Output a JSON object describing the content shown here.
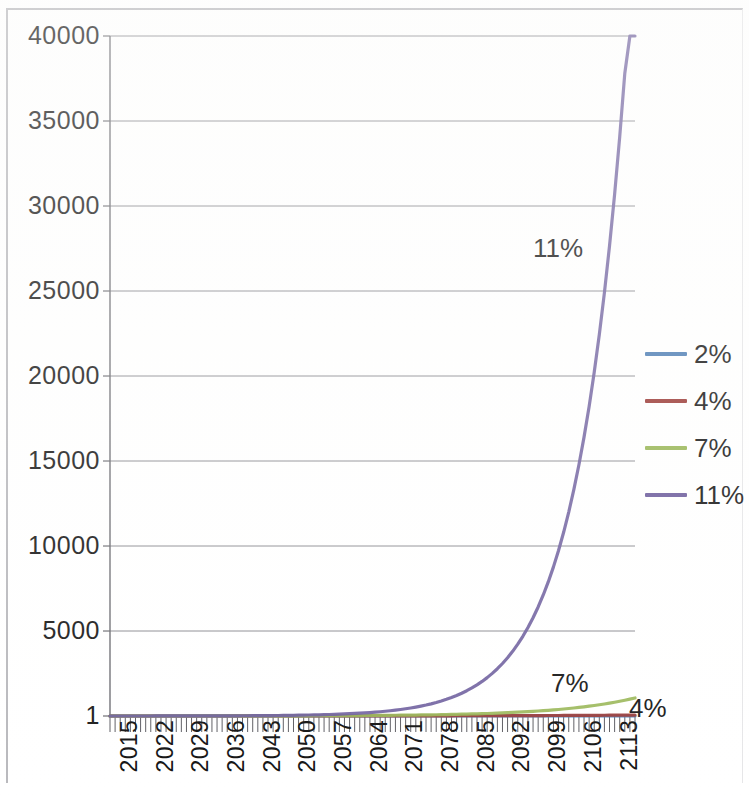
{
  "chart_data": {
    "type": "line",
    "title": "",
    "subtitle": "",
    "xlabel": "",
    "ylabel": "",
    "grid": true,
    "legend_position": "right",
    "xlim": [
      2015,
      2118
    ],
    "ylim": [
      1,
      40000
    ],
    "y_ticks": [
      40000,
      35000,
      30000,
      25000,
      20000,
      15000,
      10000,
      5000,
      1
    ],
    "y_tick_labels": [
      "40000",
      "35000",
      "30000",
      "25000",
      "20000",
      "15000",
      "10000",
      "5000",
      "1"
    ],
    "x_ticks": [
      2015,
      2022,
      2029,
      2036,
      2043,
      2050,
      2057,
      2064,
      2071,
      2078,
      2085,
      2092,
      2099,
      2106,
      2113
    ],
    "x_tick_labels": [
      "2015",
      "2022",
      "2029",
      "2036",
      "2043",
      "2050",
      "2057",
      "2064",
      "2071",
      "2078",
      "2085",
      "2092",
      "2099",
      "2106",
      "2113"
    ],
    "x_start": 2015,
    "x_end": 2118,
    "annotations": [
      {
        "label": "11%",
        "x": 2108,
        "y": 26500
      },
      {
        "label": "7%",
        "x": 2106,
        "y": 2800
      },
      {
        "label": "4%",
        "x": 2117,
        "y": 1400
      }
    ],
    "series": [
      {
        "name": "2%",
        "color": "#4f7fb5",
        "start_value": 1,
        "growth_rate": 0.02,
        "end_value": 7.7,
        "values": [
          1,
          1.22,
          1.49,
          1.81,
          2.21,
          2.69,
          3.28,
          4.0,
          4.87,
          5.94,
          7.24
        ]
      },
      {
        "name": "4%",
        "color": "#9c3c38",
        "start_value": 1,
        "growth_rate": 0.04,
        "end_value": 57.0,
        "values": [
          1,
          1.48,
          2.19,
          3.24,
          4.8,
          7.11,
          10.52,
          15.57,
          23.05,
          34.12,
          50.5
        ]
      },
      {
        "name": "7%",
        "color": "#9ab758",
        "start_value": 1,
        "growth_rate": 0.07,
        "end_value": 1183.0,
        "values": [
          1,
          1.97,
          3.87,
          7.61,
          14.97,
          29.46,
          57.95,
          114.0,
          224.2,
          441.1,
          867.7
        ]
      },
      {
        "name": "11%",
        "color": "#6f5f9e",
        "start_value": 1,
        "growth_rate": 0.11,
        "end_value": 34000,
        "values": [
          1,
          2.84,
          8.06,
          22.89,
          65.0,
          184.6,
          524.1,
          1488.2,
          4225.1,
          11996.9,
          34064.0
        ]
      }
    ],
    "legend_entries": [
      {
        "label": "2%",
        "color": "#4f7fb5"
      },
      {
        "label": "4%",
        "color": "#9c3c38"
      },
      {
        "label": "7%",
        "color": "#9ab758"
      },
      {
        "label": "11%",
        "color": "#6f5f9e"
      }
    ]
  }
}
